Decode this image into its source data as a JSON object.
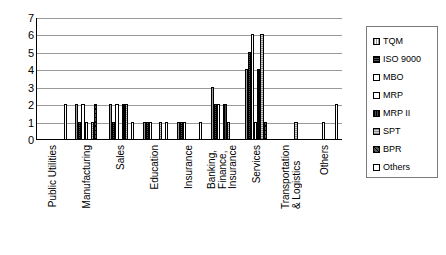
{
  "chart_data": {
    "type": "bar",
    "title": "",
    "subtitle": "",
    "xlabel": "",
    "ylabel": "",
    "ylim": [
      0,
      7
    ],
    "yticks": [
      0,
      1,
      2,
      3,
      4,
      5,
      6,
      7
    ],
    "grid": true,
    "legend_position": "right",
    "categories": [
      "Public Utilities",
      "Manufacturing",
      "Sales",
      "Education",
      "Insurance",
      "Banking,\nFinance,\nInsurance",
      "Services",
      "Transportation\n& Logistics",
      "Others"
    ],
    "series": [
      {
        "name": "TQM",
        "key": "s-tqm",
        "values": [
          0,
          2,
          2,
          1,
          1,
          3,
          4,
          0,
          0
        ]
      },
      {
        "name": "ISO 9000",
        "key": "s-iso",
        "values": [
          0,
          1,
          1,
          1,
          1,
          2,
          5,
          0,
          0
        ]
      },
      {
        "name": "MBO",
        "key": "s-mbo",
        "values": [
          0,
          2,
          2,
          1,
          1,
          2,
          6,
          0,
          0
        ]
      },
      {
        "name": "MRP",
        "key": "s-mrp",
        "values": [
          0,
          1,
          0,
          0,
          0,
          0,
          1,
          0,
          1
        ]
      },
      {
        "name": "MRP II",
        "key": "s-mrp2",
        "values": [
          0,
          0,
          2,
          0,
          0,
          2,
          4,
          0,
          0
        ]
      },
      {
        "name": "SPT",
        "key": "s-spt",
        "values": [
          0,
          1,
          2,
          1,
          0,
          1,
          6,
          1,
          0
        ]
      },
      {
        "name": "BPR",
        "key": "s-bpr",
        "values": [
          0,
          2,
          0,
          0,
          0,
          0,
          1,
          0,
          0
        ]
      },
      {
        "name": "Others",
        "key": "s-others",
        "values": [
          2,
          0,
          1,
          1,
          1,
          0,
          0,
          0,
          2
        ]
      }
    ]
  },
  "legend": {
    "items": [
      {
        "label": "TQM",
        "key": "s-tqm"
      },
      {
        "label": "ISO 9000",
        "key": "s-iso"
      },
      {
        "label": "MBO",
        "key": "s-mbo"
      },
      {
        "label": "MRP",
        "key": "s-mrp"
      },
      {
        "label": "MRP II",
        "key": "s-mrp2"
      },
      {
        "label": "SPT",
        "key": "s-spt"
      },
      {
        "label": "BPR",
        "key": "s-bpr"
      },
      {
        "label": "Others",
        "key": "s-others"
      }
    ]
  }
}
